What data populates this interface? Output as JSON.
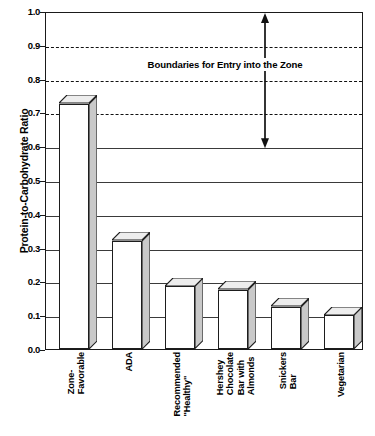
{
  "chart_data": {
    "type": "bar",
    "title": "",
    "subtitle": "",
    "xlabel": "",
    "ylabel": "Protein-to-Carbohydrate Ratio",
    "ylim": [
      0.0,
      1.0
    ],
    "ytick_labels": [
      "1.0",
      "0.9",
      "0.8",
      "0.7",
      "0.6",
      "0.5",
      "0.4",
      "0.3",
      "0.2",
      "0.1",
      "0.0"
    ],
    "ytick_values": [
      1.0,
      0.9,
      0.8,
      0.7,
      0.6,
      0.5,
      0.4,
      0.3,
      0.2,
      0.1,
      0.0
    ],
    "grid": true,
    "grid_solid_values": [
      0.6,
      0.5,
      0.4,
      0.3,
      0.2,
      0.1
    ],
    "grid_dashed_values": [
      0.9,
      0.8,
      0.7
    ],
    "legend": "none",
    "style": "3d-bar",
    "categories": [
      "Zone-\nFavorable",
      "ADA",
      "Recommended\n\"Healthy\"",
      "Hershey\nChocolate\nBar with\nAlmonds",
      "Snickers\nBar",
      "Vegetarian"
    ],
    "values": [
      0.725,
      0.32,
      0.185,
      0.175,
      0.125,
      0.1
    ],
    "annotations": [
      {
        "text": "Boundaries for Entry into the Zone",
        "type": "range-arrow",
        "from_value": 1.0,
        "to_value": 0.6,
        "label_value": 0.845
      }
    ]
  },
  "colors": {
    "background": "#ffffff",
    "frame": "#1a1a1a",
    "gridline": "#3a3a3a",
    "dashed_gridline": "#111111",
    "bar_face": "#ffffff",
    "bar_shade": "#c9c9c9",
    "bar_outline": "#1d1d1d",
    "text": "#000000"
  }
}
